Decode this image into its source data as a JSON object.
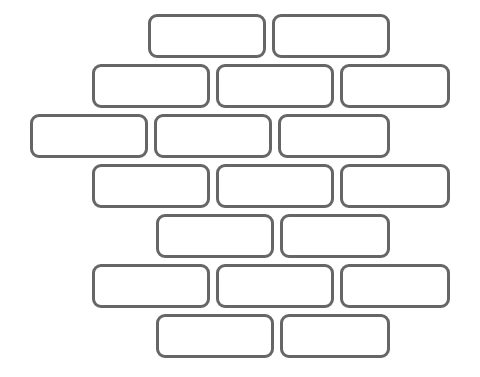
{
  "canvas": {
    "width": 480,
    "height": 377,
    "background_color": "#ffffff",
    "title": "Brick Wall Pattern"
  },
  "style": {
    "brick_fill": "#ffffff",
    "brick_stroke": "#666666",
    "brick_stroke_width": 3,
    "brick_corner_radius": 9,
    "brick_height": 44,
    "row_pitch": 50,
    "horizontal_gap": 6
  },
  "wall": {
    "pattern": "running-bond",
    "row_count": 7,
    "brick_count": 18,
    "rows": [
      {
        "index": 1,
        "y": 14,
        "brick_count": 2,
        "bricks": [
          {
            "label": "",
            "x": 148,
            "y": 14,
            "width": 118,
            "height": 44
          },
          {
            "label": "",
            "x": 272,
            "y": 14,
            "width": 118,
            "height": 44
          }
        ]
      },
      {
        "index": 2,
        "y": 64,
        "brick_count": 3,
        "bricks": [
          {
            "label": "",
            "x": 92,
            "y": 64,
            "width": 118,
            "height": 44
          },
          {
            "label": "",
            "x": 216,
            "y": 64,
            "width": 118,
            "height": 44
          },
          {
            "label": "",
            "x": 340,
            "y": 64,
            "width": 110,
            "height": 44
          }
        ]
      },
      {
        "index": 3,
        "y": 114,
        "brick_count": 3,
        "bricks": [
          {
            "label": "",
            "x": 30,
            "y": 114,
            "width": 118,
            "height": 44
          },
          {
            "label": "",
            "x": 154,
            "y": 114,
            "width": 118,
            "height": 44
          },
          {
            "label": "",
            "x": 278,
            "y": 114,
            "width": 112,
            "height": 44
          }
        ]
      },
      {
        "index": 4,
        "y": 164,
        "brick_count": 3,
        "bricks": [
          {
            "label": "",
            "x": 92,
            "y": 164,
            "width": 118,
            "height": 44
          },
          {
            "label": "",
            "x": 216,
            "y": 164,
            "width": 118,
            "height": 44
          },
          {
            "label": "",
            "x": 340,
            "y": 164,
            "width": 110,
            "height": 44
          }
        ]
      },
      {
        "index": 5,
        "y": 214,
        "brick_count": 2,
        "bricks": [
          {
            "label": "",
            "x": 156,
            "y": 214,
            "width": 118,
            "height": 44
          },
          {
            "label": "",
            "x": 280,
            "y": 214,
            "width": 110,
            "height": 44
          }
        ]
      },
      {
        "index": 6,
        "y": 264,
        "brick_count": 3,
        "bricks": [
          {
            "label": "",
            "x": 92,
            "y": 264,
            "width": 118,
            "height": 44
          },
          {
            "label": "",
            "x": 216,
            "y": 264,
            "width": 118,
            "height": 44
          },
          {
            "label": "",
            "x": 340,
            "y": 264,
            "width": 110,
            "height": 44
          }
        ]
      },
      {
        "index": 7,
        "y": 314,
        "brick_count": 2,
        "bricks": [
          {
            "label": "",
            "x": 156,
            "y": 314,
            "width": 118,
            "height": 44
          },
          {
            "label": "",
            "x": 280,
            "y": 314,
            "width": 110,
            "height": 44
          }
        ]
      }
    ]
  }
}
